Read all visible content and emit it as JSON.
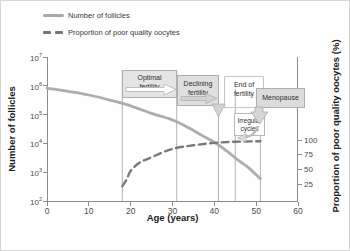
{
  "legend": {
    "items": [
      {
        "label": "Number of follicles",
        "style": "solid"
      },
      {
        "label": "Proportion of poor quality oocytes",
        "style": "dashed"
      }
    ]
  },
  "axes": {
    "x": {
      "label": "Age (years)",
      "ticks": [
        0,
        10,
        20,
        30,
        40,
        50,
        60
      ]
    },
    "y_left": {
      "label": "Number of follicles",
      "tick_base": "10",
      "tick_exponents": [
        7,
        6,
        5,
        4,
        3,
        2
      ]
    },
    "y_right": {
      "label": "Proportion of poor quality oocytes (%)",
      "ticks": [
        100,
        75,
        50,
        25
      ]
    }
  },
  "annotations": {
    "optimal": {
      "line1": "Optimal",
      "line2": "fertility"
    },
    "declining": {
      "line1": "Declining",
      "line2": "fertility"
    },
    "end": {
      "line1": "End of",
      "line2": "fertility"
    },
    "menopause": {
      "label": "Menopause"
    },
    "irregular": {
      "line1": "Irregular",
      "line2": "cycles"
    }
  },
  "colors": {
    "follicle_curve": "#adadad",
    "oocyte_curve": "#7a7a7a",
    "guide_line": "#9e9e9e",
    "axis": "#8c8c8c",
    "box_fill": "#e2e2e2",
    "text": "#3d3d3d"
  },
  "chart_data": {
    "type": "line",
    "title": "",
    "xlabel": "Age (years)",
    "x_range": [
      0,
      60
    ],
    "y_left_axis": {
      "label": "Number of follicles",
      "scale": "log",
      "range": [
        100,
        10000000
      ]
    },
    "y_right_axis": {
      "label": "Proportion of poor quality oocytes (%)",
      "range": [
        0,
        110
      ],
      "ticks": [
        25,
        50,
        75,
        100
      ]
    },
    "legend_position": "top-left",
    "grid": false,
    "guide_ages": [
      18,
      31,
      41,
      45,
      51
    ],
    "series": [
      {
        "name": "Number of follicles",
        "axis": "left",
        "style": "solid",
        "points": [
          [
            0,
            830000
          ],
          [
            5,
            640000
          ],
          [
            10,
            480000
          ],
          [
            15,
            320000
          ],
          [
            20,
            200000
          ],
          [
            25,
            110000
          ],
          [
            30,
            65000
          ],
          [
            34,
            34000
          ],
          [
            37,
            19000
          ],
          [
            40,
            11000
          ],
          [
            43,
            5400
          ],
          [
            46,
            2400
          ],
          [
            48,
            1500
          ],
          [
            51,
            600
          ]
        ]
      },
      {
        "name": "Proportion of poor quality oocytes",
        "axis": "right",
        "style": "dashed",
        "points": [
          [
            18,
            22
          ],
          [
            19,
            33
          ],
          [
            20,
            48
          ],
          [
            22,
            61
          ],
          [
            25,
            71
          ],
          [
            30,
            85
          ],
          [
            35,
            91
          ],
          [
            40,
            95
          ],
          [
            45,
            97
          ],
          [
            51,
            98
          ]
        ]
      }
    ]
  }
}
